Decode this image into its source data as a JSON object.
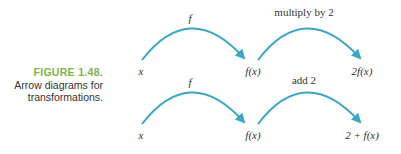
{
  "figure": {
    "number": "FIGURE 1.48.",
    "caption_line1": "Arrow diagrams for",
    "caption_line2": "transformations."
  },
  "diagrams": [
    {
      "nodes": [
        "x",
        "f(x)",
        "2f(x)"
      ],
      "arrows": [
        {
          "label": "f"
        },
        {
          "label": "multiply by 2"
        }
      ]
    },
    {
      "nodes": [
        "x",
        "f(x)",
        "2 + f(x)"
      ],
      "arrows": [
        {
          "label": "f"
        },
        {
          "label": "add 2"
        }
      ]
    }
  ],
  "colors": {
    "arrow": "#3aa7c9",
    "figure_label": "#7ab648",
    "text": "#333333"
  }
}
